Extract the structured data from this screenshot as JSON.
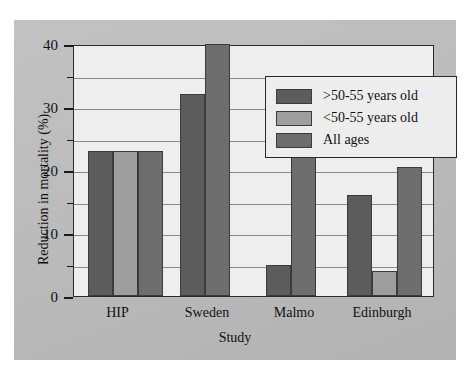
{
  "chart_data": {
    "type": "bar",
    "title": "",
    "xlabel": "Study",
    "ylabel": "Reduction in mortality (%)",
    "categories": [
      "HIP",
      "Sweden",
      "Malmo",
      "Edinburgh"
    ],
    "ylim": [
      0,
      40
    ],
    "yticks": [
      0,
      10,
      20,
      30,
      40
    ],
    "ytick_labels": [
      "0",
      "10",
      "20",
      "30",
      "40"
    ],
    "minor_ticks": [
      5,
      15,
      25,
      35
    ],
    "gridlines": [
      25,
      30,
      35
    ],
    "grid": true,
    "legend_position": "upper-center-right",
    "series": [
      {
        "name": ">50-55 years old",
        "color": "#5c5c5c",
        "values": [
          23,
          32,
          5,
          16
        ]
      },
      {
        "name": "<50-55 years old",
        "color": "#9e9e9e",
        "values": [
          23,
          null,
          null,
          4
        ]
      },
      {
        "name": "All ages",
        "color": "#6d6d6d",
        "values": [
          23,
          40,
          22.5,
          20.5
        ]
      }
    ]
  },
  "legend": {
    "items": [
      {
        "label": ">50-55 years old",
        "swatch": "#5c5c5c"
      },
      {
        "label": "<50-55 years old",
        "swatch": "#9e9e9e"
      },
      {
        "label": "All ages",
        "swatch": "#6d6d6d"
      }
    ]
  },
  "axes": {
    "y_title": "Reduction in mortality (%)",
    "x_title": "Study",
    "y_labels": [
      "40",
      "30",
      "20",
      "10",
      "0"
    ],
    "x_labels": [
      "HIP",
      "Sweden",
      "Malmo",
      "Edinburgh"
    ]
  },
  "colors": {
    "panel_background": "#b9b9b9",
    "plot_background": "#eeeeee",
    "axis": "#2a2a2a",
    "grid": "#8a8a8a",
    "series_1": "#5c5c5c",
    "series_2": "#9e9e9e",
    "series_3": "#6d6d6d"
  }
}
